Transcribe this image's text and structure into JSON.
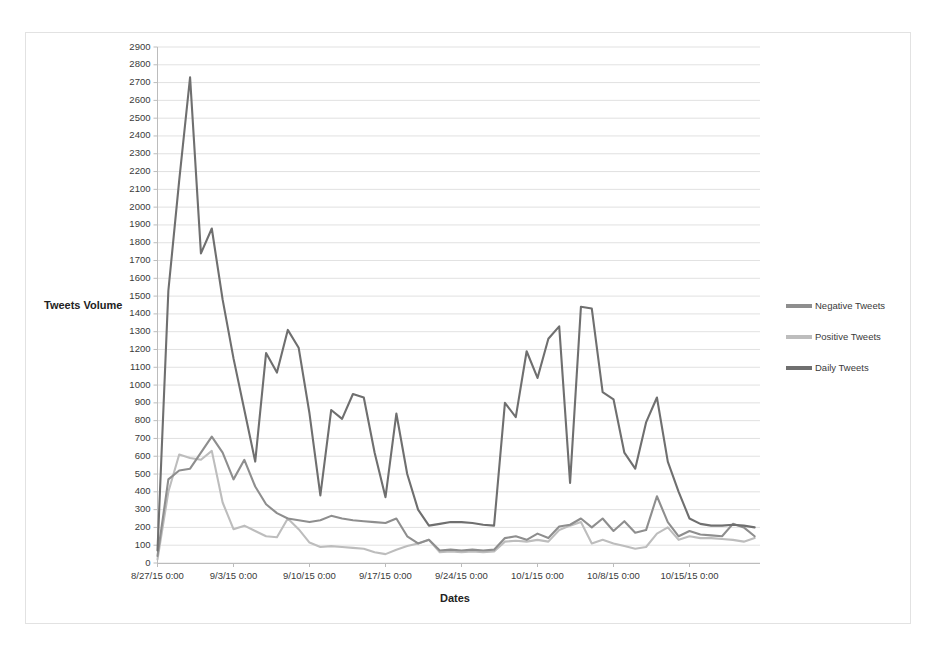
{
  "chart_data": {
    "type": "line",
    "title": "",
    "xlabel": "Dates",
    "ylabel": "Tweets Volume",
    "ylim": [
      0,
      2900
    ],
    "ytick_step": 100,
    "grid": true,
    "legend_position": "right",
    "x_tick_labels": [
      "8/27/15 0:00",
      "9/3/15 0:00",
      "9/10/15 0:00",
      "9/17/15 0:00",
      "9/24/15 0:00",
      "10/1/15 0:00",
      "10/8/15 0:00",
      "10/15/15 0:00"
    ],
    "y_tick_labels": [
      "2900",
      "2800",
      "2700",
      "2600",
      "2500",
      "2400",
      "2300",
      "2200",
      "2100",
      "2000",
      "1900",
      "1800",
      "1700",
      "1600",
      "1500",
      "1400",
      "1300",
      "1200",
      "1100",
      "1000",
      "900",
      "800",
      "700",
      "600",
      "500",
      "400",
      "300",
      "200",
      "100",
      "0"
    ],
    "x": [
      0,
      1,
      2,
      3,
      4,
      5,
      6,
      7,
      8,
      9,
      10,
      11,
      12,
      13,
      14,
      15,
      16,
      17,
      18,
      19,
      20,
      21,
      22,
      23,
      24,
      25,
      26,
      27,
      28,
      29,
      30,
      31,
      32,
      33,
      34,
      35,
      36,
      37,
      38,
      39,
      40,
      41,
      42,
      43,
      44,
      45,
      46,
      47,
      48,
      49,
      50,
      51,
      52,
      53,
      54,
      55
    ],
    "series": [
      {
        "name": "Daily Tweets",
        "color": "#6f6f6f",
        "values": [
          70,
          1530,
          2150,
          2730,
          1740,
          1880,
          1480,
          1150,
          860,
          570,
          1180,
          1070,
          1310,
          1210,
          840,
          380,
          860,
          810,
          950,
          930,
          620,
          370,
          840,
          500,
          300,
          210,
          220,
          230,
          230,
          225,
          215,
          210,
          900,
          820,
          1190,
          1040,
          1260,
          1330,
          450,
          1440,
          1430,
          960,
          920,
          620,
          530,
          790,
          930,
          570,
          400,
          250,
          220,
          210,
          210,
          215,
          210,
          200
        ]
      },
      {
        "name": "Negative Tweets",
        "color": "#8e8e8e",
        "values": [
          40,
          470,
          520,
          530,
          620,
          710,
          620,
          470,
          580,
          430,
          330,
          280,
          250,
          240,
          230,
          240,
          265,
          250,
          240,
          235,
          230,
          225,
          250,
          150,
          110,
          130,
          70,
          75,
          70,
          75,
          70,
          75,
          140,
          150,
          130,
          165,
          140,
          205,
          215,
          250,
          200,
          250,
          180,
          235,
          170,
          185,
          375,
          230,
          150,
          180,
          160,
          155,
          150,
          220,
          200,
          150
        ]
      },
      {
        "name": "Positive Tweets",
        "color": "#bdbdbd",
        "values": [
          20,
          400,
          610,
          590,
          580,
          630,
          340,
          190,
          210,
          180,
          150,
          145,
          250,
          190,
          115,
          90,
          95,
          90,
          85,
          80,
          60,
          50,
          75,
          95,
          110,
          130,
          60,
          65,
          60,
          65,
          60,
          65,
          120,
          125,
          120,
          130,
          120,
          185,
          210,
          230,
          110,
          130,
          110,
          95,
          80,
          90,
          165,
          200,
          130,
          150,
          140,
          140,
          135,
          130,
          120,
          140
        ]
      }
    ]
  },
  "legend": {
    "items": [
      {
        "label": "Negative Tweets",
        "color": "#8e8e8e"
      },
      {
        "label": "Positive Tweets",
        "color": "#bdbdbd"
      },
      {
        "label": "Daily Tweets",
        "color": "#6f6f6f"
      }
    ]
  }
}
